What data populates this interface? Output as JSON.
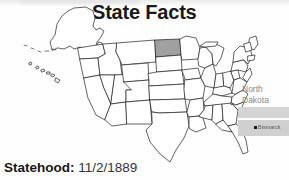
{
  "page": {
    "title": "State Facts",
    "background_color": "#fefefe",
    "text_color": "#1a1a1a"
  },
  "map": {
    "name": "united-states-outline-map",
    "highlighted_state": "North Dakota",
    "highlight_color": "#a0a0a0",
    "outline_color": "#1f1f1f",
    "fill_color": "#ffffff",
    "includes_insets": [
      "Alaska",
      "Hawaii"
    ]
  },
  "inset": {
    "state_name_line1": "North",
    "state_name_line2": "Dakota",
    "label_color": "#8a8a8a",
    "band_color": "#d4d4d4",
    "capital_city": "Bismarck",
    "capital_marker_color": "#1a1a1a"
  },
  "facts": [
    {
      "label": "Statehood:",
      "value": "11/2/1889"
    }
  ]
}
